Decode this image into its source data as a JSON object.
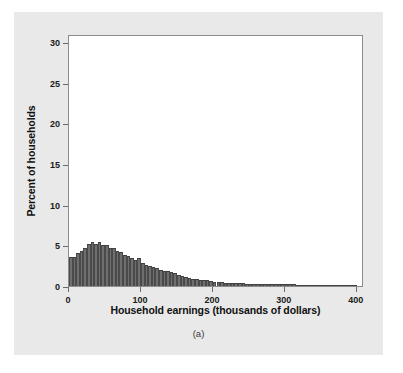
{
  "figure": {
    "caption": "(a)",
    "panel_color": "#e9e9e9",
    "plot_bg": "#ffffff",
    "frame_color": "#8c8c8c"
  },
  "chart_data": {
    "type": "bar",
    "title": "",
    "subtitle": "",
    "xlabel": "Household earnings (thousands of dollars)",
    "ylabel": "Percent of households",
    "xlim": [
      0,
      410
    ],
    "ylim": [
      0,
      31
    ],
    "grid": false,
    "legend": null,
    "bar_color": "#6f6f6f",
    "bar_edge_color": "#3f3f3f",
    "bin_width": 5,
    "xticks": [
      0,
      100,
      200,
      300,
      400
    ],
    "xtick_labels": [
      "0",
      "100",
      "200",
      "300",
      "400"
    ],
    "yticks": [
      0,
      5,
      10,
      15,
      20,
      25,
      30
    ],
    "ytick_labels": [
      "0",
      "5",
      "10",
      "15",
      "20",
      "25",
      "30"
    ],
    "x": [
      2.5,
      7.5,
      12.5,
      17.5,
      22.5,
      27.5,
      32.5,
      37.5,
      42.5,
      47.5,
      52.5,
      57.5,
      62.5,
      67.5,
      72.5,
      77.5,
      82.5,
      87.5,
      92.5,
      97.5,
      102.5,
      107.5,
      112.5,
      117.5,
      122.5,
      127.5,
      132.5,
      137.5,
      142.5,
      147.5,
      152.5,
      157.5,
      162.5,
      167.5,
      172.5,
      177.5,
      182.5,
      187.5,
      192.5,
      197.5,
      202.5,
      207.5,
      212.5,
      217.5,
      222.5,
      227.5,
      232.5,
      237.5,
      242.5,
      247.5,
      252.5,
      257.5,
      262.5,
      267.5,
      272.5,
      277.5,
      282.5,
      287.5,
      292.5,
      297.5,
      302.5,
      307.5,
      312.5,
      317.5,
      322.5,
      327.5,
      332.5,
      337.5,
      342.5,
      347.5,
      352.5,
      357.5,
      362.5,
      367.5,
      372.5,
      377.5,
      382.5,
      387.5,
      392.5,
      397.5
    ],
    "categories": [
      "0-5",
      "5-10",
      "10-15",
      "15-20",
      "20-25",
      "25-30",
      "30-35",
      "35-40",
      "40-45",
      "45-50",
      "50-55",
      "55-60",
      "60-65",
      "65-70",
      "70-75",
      "75-80",
      "80-85",
      "85-90",
      "90-95",
      "95-100",
      "100-105",
      "105-110",
      "110-115",
      "115-120",
      "120-125",
      "125-130",
      "130-135",
      "135-140",
      "140-145",
      "145-150",
      "150-155",
      "155-160",
      "160-165",
      "165-170",
      "170-175",
      "175-180",
      "180-185",
      "185-190",
      "190-195",
      "195-200",
      "200-205",
      "205-210",
      "210-215",
      "215-220",
      "220-225",
      "225-230",
      "230-235",
      "235-240",
      "240-245",
      "245-250",
      "250-255",
      "255-260",
      "260-265",
      "265-270",
      "270-275",
      "275-280",
      "280-285",
      "285-290",
      "290-295",
      "295-300",
      "300-305",
      "305-310",
      "310-315",
      "315-320",
      "320-325",
      "325-330",
      "330-335",
      "335-340",
      "340-345",
      "345-350",
      "350-355",
      "355-360",
      "360-365",
      "365-370",
      "370-375",
      "375-380",
      "380-385",
      "385-390",
      "390-395",
      "395-400"
    ],
    "values": [
      3.6,
      3.6,
      4.0,
      4.3,
      4.7,
      5.2,
      5.4,
      5.2,
      5.4,
      5.0,
      5.1,
      4.7,
      4.7,
      4.3,
      4.2,
      3.8,
      3.7,
      3.4,
      3.2,
      3.4,
      2.8,
      2.6,
      2.5,
      2.3,
      2.2,
      2.0,
      1.9,
      1.8,
      1.7,
      1.6,
      1.3,
      1.2,
      1.1,
      1.0,
      0.9,
      0.85,
      0.8,
      0.75,
      0.7,
      0.65,
      0.55,
      0.5,
      0.45,
      0.42,
      0.4,
      0.38,
      0.35,
      0.33,
      0.31,
      0.3,
      0.28,
      0.27,
      0.26,
      0.25,
      0.24,
      0.23,
      0.22,
      0.21,
      0.21,
      0.2,
      0.2,
      0.19,
      0.19,
      0.18,
      0.18,
      0.17,
      0.17,
      0.17,
      0.16,
      0.16,
      0.16,
      0.15,
      0.15,
      0.15,
      0.15,
      0.14,
      0.14,
      0.14,
      0.14,
      0.14
    ]
  }
}
